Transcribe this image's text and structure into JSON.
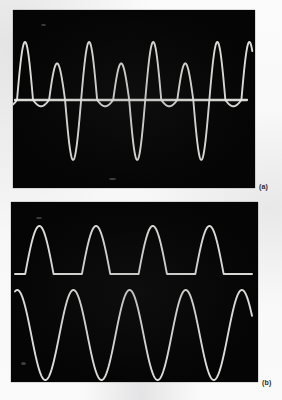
{
  "figure": {
    "background_color": "#fbfbfb",
    "screen_color": "#050505",
    "trace_color": "#ededea",
    "caption_color": "#2a2a2a"
  },
  "panels": [
    {
      "id": "a",
      "caption": "(a)",
      "screen": {
        "x": 13,
        "y": 10,
        "width": 242,
        "height": 178
      },
      "description": "Oscilloscope display of an alternating-amplitude sine wave superimposed on a flat baseline trace"
    },
    {
      "id": "b",
      "caption": "(b)",
      "screen": {
        "x": 11,
        "y": 202,
        "width": 247,
        "height": 180
      },
      "description": "Oscilloscope display showing a half-wave rectified sine above a full sine wave"
    }
  ],
  "chart_data": [
    {
      "type": "line",
      "title": "(a)",
      "xlabel": "",
      "ylabel": "",
      "grid": false,
      "legend": null,
      "xlim": [
        0,
        360
      ],
      "ylim": [
        -1.05,
        1.05
      ],
      "series": [
        {
          "name": "alternating-amplitude-sine",
          "waveform": "sine",
          "cycles": 7,
          "amplitudes": [
            0.92,
            0.58,
            0.92,
            0.58,
            0.92,
            0.58,
            0.92
          ],
          "peak_count": 7,
          "trough_count": 7,
          "trough_amplitudes": [
            0.1,
            0.95,
            0.1,
            0.95,
            0.1,
            0.95,
            0.1
          ],
          "baseline": 0.0,
          "color": "#ededea"
        },
        {
          "name": "flat-baseline-trace",
          "waveform": "flat",
          "value": 0.0,
          "color": "#ededea"
        }
      ]
    },
    {
      "type": "line",
      "title": "(b)",
      "xlabel": "",
      "ylabel": "",
      "grid": false,
      "legend": null,
      "xlim": [
        0,
        360
      ],
      "ylim": [
        -1.05,
        1.05
      ],
      "series": [
        {
          "name": "half-wave-rectified-sine",
          "waveform": "half-wave-rectified-sine",
          "cycles": 4,
          "amplitude": 1.0,
          "baseline": 0.0,
          "trace_position": "upper",
          "color": "#ededea"
        },
        {
          "name": "sine-wave",
          "waveform": "sine",
          "cycles": 4,
          "amplitude": 1.0,
          "baseline": 0.0,
          "trace_position": "lower",
          "color": "#ededea"
        }
      ]
    }
  ]
}
